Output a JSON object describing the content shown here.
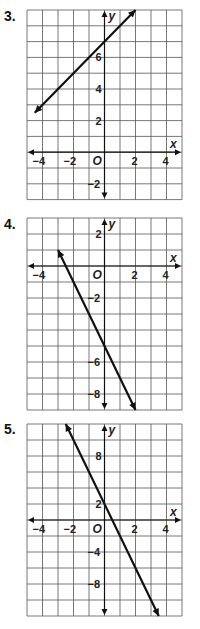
{
  "chart_data": [
    {
      "type": "line",
      "label": "3.",
      "equation": "y = x + 7",
      "xlim": [
        -5,
        5
      ],
      "ylim": [
        -3,
        9
      ],
      "x_ticks": [
        -4,
        -2,
        2,
        4
      ],
      "y_ticks": [
        -2,
        2,
        4,
        6
      ],
      "origin_label": "O",
      "xlabel": "x",
      "ylabel": "y",
      "grid": true,
      "x_unit_per_cell": 1,
      "y_unit_per_cell": 1,
      "points": [
        [
          -4.5,
          2.5
        ],
        [
          2,
          9
        ]
      ]
    },
    {
      "type": "line",
      "label": "4.",
      "equation": "y = -2x - 5",
      "xlim": [
        -5,
        5
      ],
      "ylim": [
        -9,
        3
      ],
      "x_ticks": [
        -4,
        2,
        4
      ],
      "y_ticks": [
        -8,
        -6,
        -2,
        2
      ],
      "origin_label": "O",
      "xlabel": "x",
      "ylabel": "y",
      "grid": true,
      "x_unit_per_cell": 1,
      "y_unit_per_cell": 1,
      "points": [
        [
          -3,
          1
        ],
        [
          2,
          -9
        ]
      ]
    },
    {
      "type": "line",
      "label": "5.",
      "equation": "y = -4x + 2",
      "xlim": [
        -5,
        5
      ],
      "ylim": [
        -12,
        12
      ],
      "x_ticks": [
        -4,
        -2,
        2,
        4
      ],
      "y_ticks": [
        -8,
        -4,
        2,
        8
      ],
      "origin_label": "O",
      "xlabel": "x",
      "ylabel": "y",
      "grid": true,
      "x_unit_per_cell": 1,
      "y_unit_per_cell": 2,
      "points": [
        [
          -2.5,
          12
        ],
        [
          3.5,
          -12
        ]
      ]
    }
  ],
  "labels": {
    "p3": "3.",
    "p4": "4.",
    "p5": "5.",
    "footer": "Quick Check"
  }
}
